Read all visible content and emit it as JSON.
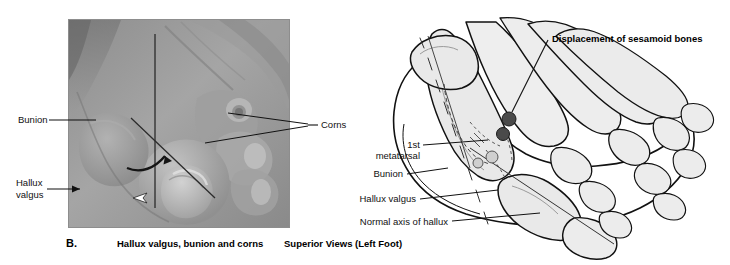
{
  "figure": {
    "background_color": "#ffffff",
    "panel_label": "B.",
    "photo_caption": "Hallux valgus, bunion and corns",
    "diagram_caption": "Superior Views (Left Foot)"
  },
  "photo_panel": {
    "name": "clinical-photograph-of-foot",
    "description": "Grayscale clinical photograph of a left foot showing hallux valgus deformity",
    "frame_color": "#8d8d8d",
    "labels": [
      {
        "id": "bunion",
        "text": "Bunion",
        "lines": [
          "Bunion"
        ]
      },
      {
        "id": "hallux-valgus",
        "text": "Hallux valgus",
        "lines": [
          "Hallux",
          "valgus"
        ]
      },
      {
        "id": "corns",
        "text": "Corns",
        "lines": [
          "Corns"
        ]
      }
    ]
  },
  "diagram_panel": {
    "name": "skeletal-diagram-of-foot",
    "description": "Line drawing of left foot skeleton, superior view, showing hallux valgus",
    "title": "Displacement of sesamoid bones",
    "labels": [
      {
        "id": "first-metatarsal",
        "text": "1st metatarsal",
        "lines": [
          "1st",
          "metatarsal"
        ]
      },
      {
        "id": "bunion",
        "text": "Bunion",
        "lines": [
          "Bunion"
        ]
      },
      {
        "id": "hallux-valgus",
        "text": "Hallux valgus",
        "lines": [
          "Hallux valgus"
        ]
      },
      {
        "id": "normal-axis-of-hallux",
        "text": "Normal axis of hallux",
        "lines": [
          "Normal axis of hallux"
        ]
      }
    ],
    "sesamoid_bones": {
      "count": 2,
      "fill_color": "#4a4a4a"
    },
    "bone_fill_color": "#e8e8e8",
    "bone_outline_color": "#111111"
  }
}
